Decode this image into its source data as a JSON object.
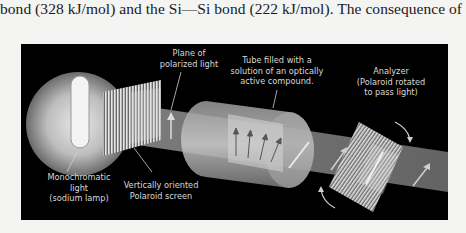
{
  "text": {
    "line": "bond (328 kJ/mol) and the Si—Si bond (222 kJ/mol). The consequence of high"
  },
  "figure": {
    "labels": {
      "lamp": [
        "Monochromatic",
        "light",
        "(sodium lamp)"
      ],
      "polaroid": [
        "Vertically oriented",
        "Polaroid screen"
      ],
      "plane": [
        "Plane of",
        "polarized light"
      ],
      "tube": [
        "Tube filled with a",
        "solution of an optically",
        "active compound."
      ],
      "analyzer": [
        "Analyzer",
        "(Polaroid rotated",
        "to pass light)"
      ]
    },
    "colors": {
      "background": "#000000",
      "beam": "#7a7a7a",
      "label": "#d8d8d8"
    }
  }
}
